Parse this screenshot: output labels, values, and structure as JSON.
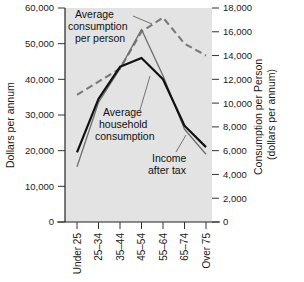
{
  "chart_data": {
    "type": "line",
    "title": "",
    "categories": [
      "Under 25",
      "25–34",
      "35–44",
      "45–54",
      "55–64",
      "65–74",
      "Over 75"
    ],
    "xlabel": "",
    "ylabel": "Dollars per annum",
    "ylim": [
      0,
      60000
    ],
    "y_ticks": [
      "0",
      "10,000",
      "20,000",
      "30,000",
      "40,000",
      "50,000",
      "60,000"
    ],
    "y2label": "Consumption per Person (dollars per annum)",
    "y2label_line1": "Consumption per Person",
    "y2label_line2": "(dollars per annum)",
    "y2lim": [
      0,
      18000
    ],
    "y2_ticks": [
      "0",
      "2,000",
      "4,000",
      "6,000",
      "8,000",
      "10,000",
      "12,000",
      "14,000",
      "16,000",
      "18,000"
    ],
    "grid": false,
    "legend": "annotations-inline",
    "series": [
      {
        "name": "Average consumption per person",
        "axis": "right",
        "style": "dashed",
        "color": "#7a7a7a",
        "values": [
          10700,
          11800,
          12900,
          16000,
          17200,
          15000,
          14000
        ]
      },
      {
        "name": "Income after tax",
        "axis": "left",
        "style": "solid-thin",
        "color": "#6e6e6e",
        "values": [
          15500,
          33500,
          43000,
          54000,
          41000,
          26000,
          19000
        ]
      },
      {
        "name": "Average household consumption",
        "axis": "left",
        "style": "solid-thick",
        "color": "#111111",
        "values": [
          19500,
          34500,
          43500,
          46000,
          40000,
          27000,
          21000
        ]
      }
    ],
    "annotations": [
      {
        "id": "avg-consumption-per-person",
        "lines": [
          "Average",
          "consumption",
          "per person"
        ]
      },
      {
        "id": "avg-household-consumption",
        "lines": [
          "Average",
          "household",
          "consumption"
        ]
      },
      {
        "id": "income-after-tax",
        "lines": [
          "Income",
          "after tax"
        ]
      }
    ]
  },
  "style": {
    "plot_background": "#e3e3e3",
    "page_background": "#ffffff",
    "axis_color": "#222222",
    "text_color": "#1a1a1a"
  }
}
